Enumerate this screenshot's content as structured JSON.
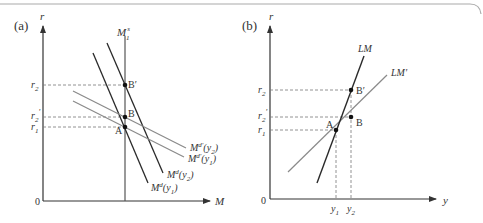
{
  "panels": [
    {
      "id": "a",
      "label": "(a)",
      "y_axis_label": "r",
      "x_axis_label": "M",
      "origin_label": "0",
      "supply_label": "M",
      "supply_sup": "s",
      "supply_sub": "1",
      "r_ticks": [
        {
          "base": "r",
          "sub": "2",
          "prime": ""
        },
        {
          "base": "r",
          "sub": "2",
          "prime": "'"
        },
        {
          "base": "r",
          "sub": "1",
          "prime": ""
        }
      ],
      "points": [
        {
          "name": "B'",
          "label": "B′"
        },
        {
          "name": "B",
          "label": "B"
        },
        {
          "name": "A",
          "label": "A"
        }
      ],
      "curves": [
        {
          "base": "M",
          "sup": "d'",
          "arg": "(y",
          "sub": "2",
          "close": ")"
        },
        {
          "base": "M",
          "sup": "d'",
          "arg": "(y",
          "sub": "1",
          "close": ")"
        },
        {
          "base": "M",
          "sup": "d",
          "arg": "(y",
          "sub": "2",
          "close": ")"
        },
        {
          "base": "M",
          "sup": "d",
          "arg": "(y",
          "sub": "1",
          "close": ")"
        }
      ]
    },
    {
      "id": "b",
      "label": "(b)",
      "y_axis_label": "r",
      "x_axis_label": "y",
      "origin_label": "0",
      "r_ticks": [
        {
          "base": "r",
          "sub": "2",
          "prime": ""
        },
        {
          "base": "r",
          "sub": "2",
          "prime": "'"
        },
        {
          "base": "r",
          "sub": "1",
          "prime": ""
        }
      ],
      "y_ticks": [
        {
          "base": "y",
          "sub": "1"
        },
        {
          "base": "y",
          "sub": "2"
        }
      ],
      "points": [
        {
          "name": "B'",
          "label": "B′"
        },
        {
          "name": "B",
          "label": "B"
        },
        {
          "name": "A",
          "label": "A"
        }
      ],
      "curves": [
        {
          "label": "LM"
        },
        {
          "label": "LM′"
        }
      ]
    }
  ],
  "colors": {
    "dark_line": "#2a2a2a",
    "gray_line": "#8a8a8a",
    "dashed": "#777777",
    "frame": "#aaaaaa"
  }
}
